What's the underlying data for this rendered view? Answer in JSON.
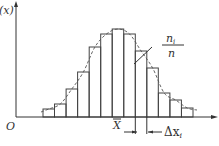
{
  "chart_data": {
    "type": "bar",
    "subtype": "histogram-with-density-curve",
    "title": "",
    "ylabel": "f(x)",
    "ylabel_visible": "(x)",
    "origin_label": "O",
    "mean_label": "X",
    "bin_width_label": "Δx",
    "bin_width_subscript": "i",
    "annotation": {
      "numerator": "n",
      "numerator_subscript": "i",
      "denominator": "n"
    },
    "bins": 13,
    "values": [
      8,
      13,
      28,
      45,
      70,
      83,
      88,
      83,
      66,
      49,
      24,
      17,
      9
    ],
    "mean_bin_index": 6,
    "highlight_bin_index": 8,
    "ylim": [
      0,
      100
    ],
    "grid": false,
    "legend": "none"
  }
}
